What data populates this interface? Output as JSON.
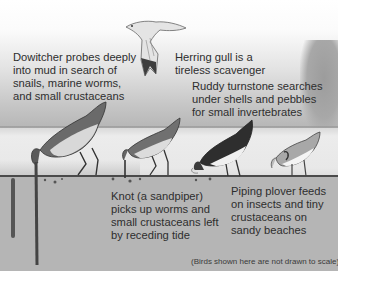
{
  "figure": {
    "labels": {
      "dowitcher": [
        "Dowitcher probes deeply",
        "into mud in search of",
        "snails, marine worms,",
        "and small crustaceans"
      ],
      "herring_gull": [
        "Herring gull is a",
        "tireless scavenger"
      ],
      "ruddy_turnstone": [
        "Ruddy turnstone searches",
        "under shells and pebbles",
        "for small invertebrates"
      ],
      "knot": [
        "Knot (a sandpiper)",
        "picks up worms and",
        "small crustaceans left",
        "by receding tide"
      ],
      "piping_plover": [
        "Piping plover feeds",
        "on insects and tiny",
        "crustaceans on",
        "sandy beaches"
      ]
    },
    "footnote": "(Birds shown here are not drawn to scale)",
    "colors": {
      "sky_top": "#ffffff",
      "sky_bottom": "#b6b6b6",
      "sand": "#e8e8e8",
      "mud": "#b5b5b5",
      "bird_dark": "#3a3a3a",
      "bird_light": "#eeeeee"
    }
  }
}
